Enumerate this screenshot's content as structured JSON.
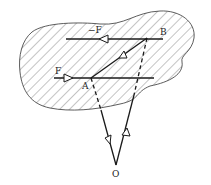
{
  "diagram": {
    "labels": {
      "force_top": "−F",
      "force_bottom": "F",
      "point_a": "A",
      "point_b": "B",
      "origin": "O"
    },
    "colors": {
      "stroke": "#1a1a1a",
      "hatch": "#555555",
      "background": "#ffffff"
    }
  }
}
